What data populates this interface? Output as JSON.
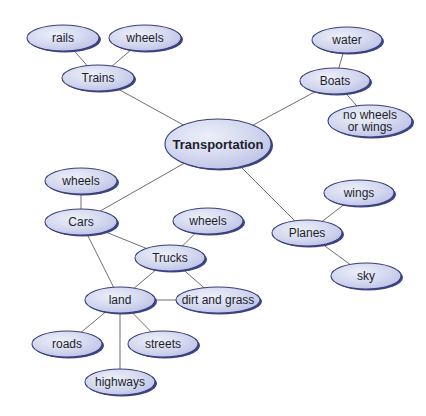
{
  "diagram": {
    "type": "concept-map",
    "central": "Transportation",
    "colors": {
      "node_fill": "#d3d8ef",
      "node_highlight": "#e8ebf8",
      "node_border": "#3a3f7a",
      "node_shadow": "#3e4488",
      "edge": "#6f6f6f",
      "text": "#1e1e2a",
      "background": "#ffffff"
    },
    "nodes": [
      {
        "id": "transportation",
        "label": "Transportation",
        "cx": 218,
        "cy": 144,
        "rx": 53,
        "ry": 25,
        "main": true
      },
      {
        "id": "trains",
        "label": "Trains",
        "cx": 98,
        "cy": 78,
        "rx": 36,
        "ry": 13
      },
      {
        "id": "rails",
        "label": "rails",
        "cx": 63,
        "cy": 38,
        "rx": 36,
        "ry": 13
      },
      {
        "id": "trains-wheels",
        "label": "wheels",
        "cx": 145,
        "cy": 38,
        "rx": 36,
        "ry": 13
      },
      {
        "id": "boats",
        "label": "Boats",
        "cx": 335,
        "cy": 81,
        "rx": 35,
        "ry": 13
      },
      {
        "id": "water",
        "label": "water",
        "cx": 347,
        "cy": 40,
        "rx": 35,
        "ry": 13
      },
      {
        "id": "no-wheels-or-wings",
        "label": "no wheels or wings",
        "lines": [
          "no wheels",
          "or wings"
        ],
        "cx": 370,
        "cy": 121,
        "rx": 42,
        "ry": 16
      },
      {
        "id": "cars",
        "label": "Cars",
        "cx": 81,
        "cy": 222,
        "rx": 36,
        "ry": 13
      },
      {
        "id": "cars-wheels",
        "label": "wheels",
        "cx": 81,
        "cy": 181,
        "rx": 36,
        "ry": 13
      },
      {
        "id": "trucks",
        "label": "Trucks",
        "cx": 170,
        "cy": 258,
        "rx": 35,
        "ry": 13
      },
      {
        "id": "trucks-wheels",
        "label": "wheels",
        "cx": 208,
        "cy": 221,
        "rx": 35,
        "ry": 13
      },
      {
        "id": "land",
        "label": "land",
        "cx": 120,
        "cy": 300,
        "rx": 35,
        "ry": 13
      },
      {
        "id": "dirt-and-grass",
        "label": "dirt and grass",
        "cx": 218,
        "cy": 300,
        "rx": 42,
        "ry": 13
      },
      {
        "id": "roads",
        "label": "roads",
        "cx": 67,
        "cy": 344,
        "rx": 35,
        "ry": 13
      },
      {
        "id": "streets",
        "label": "streets",
        "cx": 163,
        "cy": 344,
        "rx": 35,
        "ry": 13
      },
      {
        "id": "highways",
        "label": "highways",
        "cx": 120,
        "cy": 382,
        "rx": 35,
        "ry": 13
      },
      {
        "id": "planes",
        "label": "Planes",
        "cx": 307,
        "cy": 233,
        "rx": 35,
        "ry": 13
      },
      {
        "id": "wings",
        "label": "wings",
        "cx": 359,
        "cy": 193,
        "rx": 35,
        "ry": 13
      },
      {
        "id": "sky",
        "label": "sky",
        "cx": 366,
        "cy": 276,
        "rx": 35,
        "ry": 13
      }
    ],
    "edges": [
      [
        "transportation",
        "trains"
      ],
      [
        "transportation",
        "boats"
      ],
      [
        "transportation",
        "cars"
      ],
      [
        "transportation",
        "planes"
      ],
      [
        "trains",
        "rails"
      ],
      [
        "trains",
        "trains-wheels"
      ],
      [
        "boats",
        "water"
      ],
      [
        "boats",
        "no-wheels-or-wings"
      ],
      [
        "cars",
        "cars-wheels"
      ],
      [
        "cars",
        "trucks"
      ],
      [
        "cars",
        "land"
      ],
      [
        "trucks",
        "trucks-wheels"
      ],
      [
        "trucks",
        "land"
      ],
      [
        "trucks",
        "dirt-and-grass"
      ],
      [
        "land",
        "dirt-and-grass"
      ],
      [
        "land",
        "roads"
      ],
      [
        "land",
        "streets"
      ],
      [
        "land",
        "highways"
      ],
      [
        "planes",
        "wings"
      ],
      [
        "planes",
        "sky"
      ]
    ]
  }
}
